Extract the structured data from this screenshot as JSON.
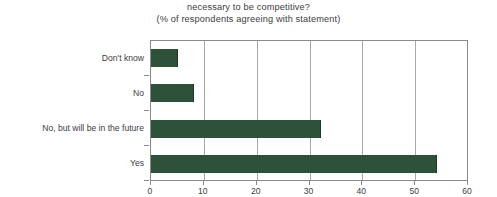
{
  "chart_data": {
    "type": "bar",
    "orientation": "horizontal",
    "title": "necessary to be competitive?",
    "subtitle": "(% of respondents agreeing with statement)",
    "categories": [
      "Yes",
      "No, but will be in the future",
      "No",
      "Don't know"
    ],
    "values": [
      54,
      32,
      8,
      5
    ],
    "xlabel": "",
    "ylabel": "",
    "xlim": [
      0,
      60
    ],
    "xticks": [
      0,
      10,
      20,
      30,
      40,
      50,
      60
    ],
    "xtick_labels": [
      "0",
      "10",
      "20",
      "30",
      "40",
      "50",
      "60"
    ],
    "grid": "vertical",
    "legend": "none",
    "series": [
      {
        "name": "% of respondents agreeing with statement",
        "color": "#2d5139",
        "values": [
          54,
          32,
          8,
          5
        ]
      }
    ]
  },
  "colors": {
    "bar": "#2d5139",
    "bar_edge": "#1e3828",
    "gridline": "#a9a9a9",
    "axis": "#8a8a8a",
    "text": "#3d3d3d",
    "background": "#ffffff"
  }
}
